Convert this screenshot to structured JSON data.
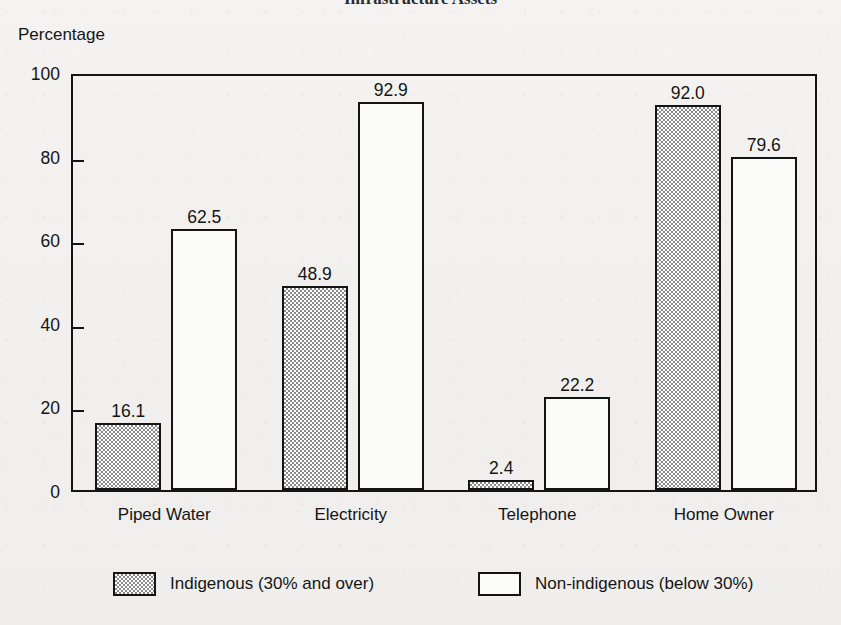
{
  "figure": {
    "title_cropped": "Infrastructure Assets",
    "axis_title": "Percentage"
  },
  "chart_data": {
    "type": "bar",
    "title": "Infrastructure Assets",
    "xlabel": "",
    "ylabel": "Percentage",
    "ylim": [
      0,
      100
    ],
    "yticks": [
      0,
      20,
      40,
      60,
      80,
      100
    ],
    "grid": false,
    "legend_position": "bottom",
    "categories": [
      "Piped Water",
      "Electricity",
      "Telephone",
      "Home Owner"
    ],
    "series": [
      {
        "name": "Indigenous (30% and over)",
        "fill": "shaded",
        "values": [
          16.1,
          48.9,
          2.4,
          92.0
        ],
        "labels": [
          "16.1",
          "48.9",
          "2.4",
          "92.0"
        ]
      },
      {
        "name": "Non-indigenous (below 30%)",
        "fill": "open",
        "values": [
          62.5,
          92.9,
          22.2,
          79.6
        ],
        "labels": [
          "62.5",
          "92.9",
          "22.2",
          "79.6"
        ]
      }
    ]
  },
  "axis": {
    "y_tick_labels": [
      "100",
      "80",
      "60",
      "40",
      "20",
      "0"
    ]
  },
  "legend": {
    "entries": [
      {
        "label": "Indigenous (30% and over)",
        "fill": "shaded"
      },
      {
        "label": "Non-indigenous (below 30%)",
        "fill": "open"
      }
    ]
  },
  "colors": {
    "ink": "#141414",
    "paper": "#f2f1ef",
    "bar_shaded": "#8a8a8a",
    "bar_open": "#ffffff"
  }
}
